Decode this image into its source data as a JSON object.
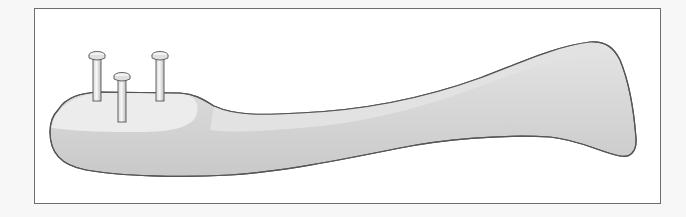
{
  "figure": {
    "colors": {
      "background": "#f7f7f7",
      "frame_fill": "#ffffff",
      "frame_border": "#6e6e6e",
      "bone_top_light": "#e6e6e6",
      "bone_body": "#cfcfcf",
      "bone_outline": "#555555",
      "pin_fill": "#eeeeee",
      "pin_outline": "#555555"
    },
    "pins": [
      {
        "name": "pin-left",
        "x": 97,
        "head_y": 55,
        "bottom_y": 100
      },
      {
        "name": "pin-middle",
        "x": 122,
        "head_y": 76,
        "bottom_y": 122
      },
      {
        "name": "pin-right",
        "x": 160,
        "head_y": 55,
        "bottom_y": 100
      }
    ]
  }
}
